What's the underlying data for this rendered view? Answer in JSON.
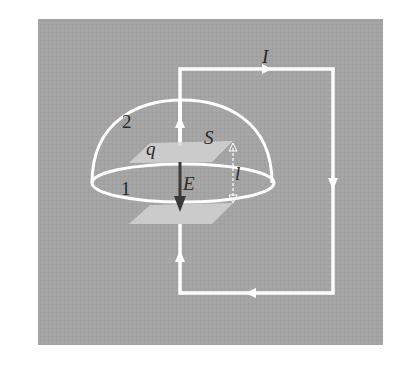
{
  "figure": {
    "background_color": "#a3a3a3",
    "wire_color": "#ffffff",
    "plate_color": "#d2d2d2",
    "field_arrow_color": "#3a3a3a",
    "labels": {
      "current": "I",
      "surface_2": "2",
      "surface_1": "1",
      "charge": "q",
      "area": "S",
      "field": "E",
      "separation": "l"
    }
  }
}
